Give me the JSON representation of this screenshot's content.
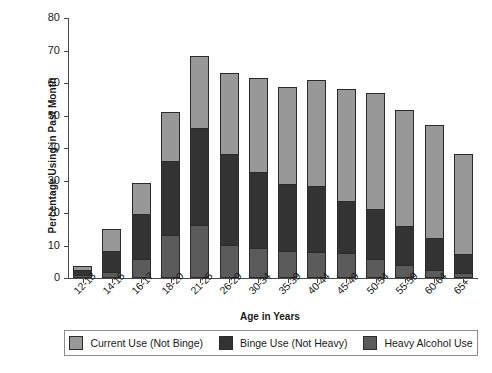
{
  "chart_data": {
    "type": "bar",
    "subtype": "stacked-bar",
    "title": "",
    "xlabel": "Age in Years",
    "ylabel": "Percentage Using in Past Month",
    "ylim": [
      0,
      80
    ],
    "yticks": [
      0,
      10,
      20,
      30,
      40,
      50,
      60,
      70,
      80
    ],
    "grid": false,
    "legend_position": "bottom",
    "categories": [
      "12-13",
      "14-15",
      "16-17",
      "18-20",
      "21-25",
      "26-29",
      "30-34",
      "35-39",
      "40-44",
      "45-49",
      "50-54",
      "55-59",
      "60-64",
      "65+"
    ],
    "series": [
      {
        "name": "Heavy Alcohol Use",
        "color": "#5b5b5b",
        "values": [
          0.6,
          1.5,
          5.4,
          13.0,
          15.9,
          10.0,
          8.8,
          8.0,
          7.6,
          7.5,
          5.5,
          3.6,
          2.1,
          1.3
        ]
      },
      {
        "name": "Binge Use  (Not Heavy)",
        "color": "#333333",
        "values": [
          1.5,
          6.4,
          13.9,
          22.8,
          29.9,
          28.0,
          23.4,
          20.5,
          20.4,
          16.0,
          15.5,
          12.2,
          9.9,
          5.7
        ]
      },
      {
        "name": "Current Use  (Not Binge)",
        "color": "#989898",
        "values": [
          1.4,
          6.9,
          9.7,
          14.9,
          22.2,
          24.8,
          29.1,
          30.1,
          32.5,
          34.5,
          35.7,
          35.7,
          34.8,
          30.9
        ]
      }
    ],
    "totals": [
      3.5,
      14.8,
      29.0,
      50.7,
      68.0,
      62.8,
      61.7,
      58.6,
      60.5,
      58.0,
      56.7,
      51.5,
      46.8,
      37.9
    ]
  },
  "legend": {
    "items": [
      {
        "label": "Current Use  (Not Binge)",
        "color": "#989898"
      },
      {
        "label": "Binge Use  (Not Heavy)",
        "color": "#333333"
      },
      {
        "label": "Heavy Alcohol Use",
        "color": "#5b5b5b"
      }
    ]
  }
}
